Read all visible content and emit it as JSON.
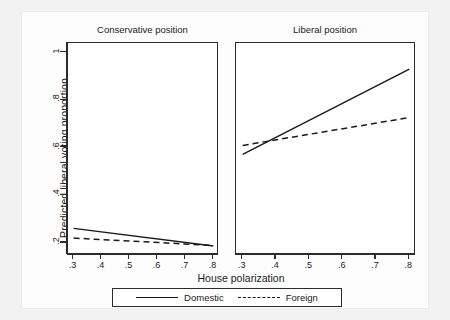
{
  "figure": {
    "background_color": "#f2f2f2",
    "plot_background_color": "#ffffff",
    "line_color": "#1a1a1a"
  },
  "axes": {
    "ylabel": "Predicted liberal voting proportion",
    "xlabel": "House polarization",
    "yticks": [
      "1",
      ".8",
      ".6",
      ".4",
      ".2"
    ],
    "ytick_values": [
      1,
      0.8,
      0.6,
      0.4,
      0.2
    ],
    "xticks": [
      ".3",
      ".4",
      ".5",
      ".6",
      ".7",
      ".8"
    ],
    "xtick_values": [
      0.3,
      0.4,
      0.5,
      0.6,
      0.7,
      0.8
    ]
  },
  "panels": [
    {
      "title": "Conservative position"
    },
    {
      "title": "Liberal position"
    }
  ],
  "legend": {
    "entries": [
      {
        "label": "Domestic",
        "style": "solid"
      },
      {
        "label": "Foreign",
        "style": "dashed"
      }
    ]
  },
  "chart_data": {
    "type": "line",
    "title": "",
    "xlabel": "House polarization",
    "ylabel": "Predicted liberal voting proportion",
    "xlim": [
      0.28,
      0.82
    ],
    "ylim": [
      0.15,
      1.04
    ],
    "grid": false,
    "legend_position": "bottom",
    "panels": [
      {
        "title": "Conservative position",
        "series": [
          {
            "name": "Domestic",
            "style": "solid",
            "x": [
              0.3,
              0.8
            ],
            "y": [
              0.262,
              0.188
            ]
          },
          {
            "name": "Foreign",
            "style": "dashed",
            "x": [
              0.3,
              0.8
            ],
            "y": [
              0.221,
              0.19
            ]
          }
        ]
      },
      {
        "title": "Liberal position",
        "series": [
          {
            "name": "Domestic",
            "style": "solid",
            "x": [
              0.3,
              0.8
            ],
            "y": [
              0.572,
              0.93
            ]
          },
          {
            "name": "Foreign",
            "style": "dashed",
            "x": [
              0.3,
              0.8
            ],
            "y": [
              0.61,
              0.727
            ]
          }
        ]
      }
    ]
  }
}
